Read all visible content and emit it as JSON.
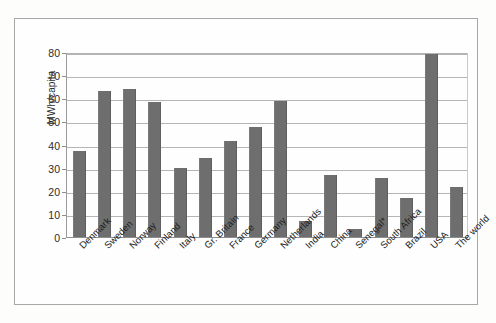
{
  "chart_data": {
    "type": "bar",
    "title": "",
    "subtitle": "",
    "xlabel": "",
    "ylabel": "MWh/capita",
    "ylim": [
      0,
      80
    ],
    "ytick_step": 10,
    "yticks": [
      "80",
      "70",
      "60",
      "50",
      "40",
      "30",
      "20",
      "10",
      "0"
    ],
    "grid": true,
    "legend": "none",
    "bar_color": "#6e6e6e",
    "categories": [
      "Denmark",
      "Sweden",
      "Norway",
      "Finland",
      "Italy",
      "Gr. Britain",
      "France",
      "Germany",
      "Netherlands",
      "India",
      "China",
      "Senegal*",
      "South Africa",
      "Brazil",
      "USA",
      "The world"
    ],
    "values": [
      37,
      63,
      64,
      58.5,
      30,
      34,
      41.5,
      47.5,
      59,
      7,
      27,
      3.5,
      25.5,
      17,
      80.5,
      21.5
    ]
  }
}
